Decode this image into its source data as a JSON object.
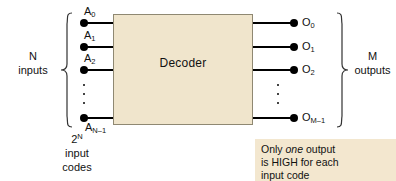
{
  "diagram": {
    "block": {
      "label": "Decoder",
      "fill_color": "#f0e5cc",
      "border_color": "#8f8872"
    },
    "inputs": {
      "group_label_line1": "N",
      "group_label_line2": "inputs",
      "codes_line1": "2",
      "codes_line1_sup": "N",
      "codes_line2": "input",
      "codes_line3": "codes",
      "pins": [
        {
          "name": "A",
          "index": "0"
        },
        {
          "name": "A",
          "index": "1"
        },
        {
          "name": "A",
          "index": "2"
        },
        {
          "name": "A",
          "index": "N–1"
        }
      ]
    },
    "outputs": {
      "group_label_line1": "M",
      "group_label_line2": "outputs",
      "pins": [
        {
          "name": "O",
          "index": "0"
        },
        {
          "name": "O",
          "index": "1"
        },
        {
          "name": "O",
          "index": "2"
        },
        {
          "name": "O",
          "index": "M–1"
        }
      ]
    },
    "note": {
      "line1_before": "Only ",
      "line1_em": "one",
      "line1_after": " output",
      "line2": "is HIGH for each",
      "line3": "input code",
      "fill_color": "#f3e7cf"
    }
  }
}
